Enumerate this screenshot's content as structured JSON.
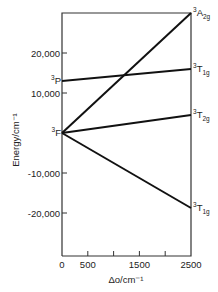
{
  "chart_data": {
    "type": "line",
    "title": "",
    "xlabel": "Δo/cm⁻¹",
    "ylabel": "Energy/cm⁻¹",
    "xlim": [
      0,
      2500
    ],
    "ylim": [
      -30000,
      30000
    ],
    "x_ticks": [
      0,
      500,
      1000,
      1500,
      2000,
      2500
    ],
    "x_tick_labels": [
      "0",
      "500",
      "",
      "1500",
      "",
      "2500"
    ],
    "y_ticks": [
      20000,
      10000,
      -10000,
      -20000
    ],
    "y_tick_labels": [
      "20,000",
      "10,000",
      "-10,000",
      "-20,000"
    ],
    "grid": false,
    "left_labels": [
      {
        "term": "3P",
        "sup": "3",
        "base": "P",
        "y": 13000
      },
      {
        "term": "3F",
        "sup": "3",
        "base": "F",
        "y": 0
      }
    ],
    "series": [
      {
        "name": "3A2g",
        "sup": "3",
        "base": "A",
        "sub": "2g",
        "x": [
          0,
          2500
        ],
        "values": [
          0,
          30000
        ]
      },
      {
        "name": "3T1g(P)",
        "sup": "3",
        "base": "T",
        "sub": "1g",
        "x": [
          0,
          2500
        ],
        "values": [
          13000,
          16000
        ]
      },
      {
        "name": "3T2g",
        "sup": "3",
        "base": "T",
        "sub": "2g",
        "x": [
          0,
          2500
        ],
        "values": [
          0,
          4500
        ]
      },
      {
        "name": "3T1g(F)",
        "sup": "3",
        "base": "T",
        "sub": "1g",
        "x": [
          0,
          2500
        ],
        "values": [
          0,
          -18750
        ]
      }
    ]
  }
}
